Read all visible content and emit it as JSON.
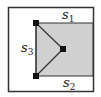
{
  "diagram": {
    "colors": {
      "background": "#ffffff",
      "outer_border": "#333333",
      "shaded_region": "#d0d0d0",
      "edge": "#333333",
      "vertex": "#111111"
    },
    "outer_box": {
      "x": 8,
      "y": 7,
      "width": 85,
      "height": 84
    },
    "shaded_region": {
      "x": 36,
      "y": 23,
      "width": 57,
      "height": 53
    },
    "vertices": [
      {
        "id": "top-left",
        "x": 36,
        "y": 23
      },
      {
        "id": "middle",
        "x": 63,
        "y": 49
      },
      {
        "id": "bottom-left",
        "x": 36,
        "y": 76
      }
    ],
    "edges": [
      {
        "from": "top-left",
        "to": "bottom-left"
      },
      {
        "from": "top-left",
        "to": "middle"
      },
      {
        "from": "middle",
        "to": "bottom-left"
      }
    ],
    "labels": {
      "s1": {
        "base": "s",
        "sub": "1"
      },
      "s2": {
        "base": "s",
        "sub": "2"
      },
      "s3": {
        "base": "s",
        "sub": "3"
      }
    }
  }
}
